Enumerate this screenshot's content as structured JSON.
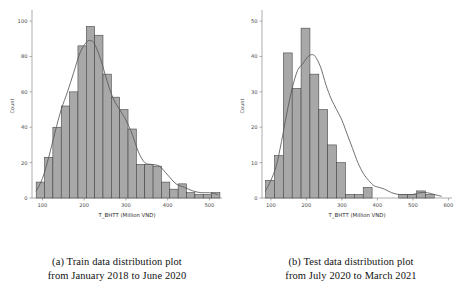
{
  "figure": {
    "panels": [
      {
        "id": "train",
        "caption_line1": "(a) Train data distribution plot",
        "caption_line2": "from January 2018 to June 2020"
      },
      {
        "id": "test",
        "caption_line1": "(b) Test data distribution plot",
        "caption_line2": "from July 2020 to March 2021"
      }
    ]
  },
  "chart_data": [
    {
      "type": "bar",
      "id": "train-histogram",
      "title": "",
      "xlabel": "T_BHTT (Million VND)",
      "ylabel": "Count",
      "xlim": [
        75,
        530
      ],
      "ylim": [
        0,
        104
      ],
      "xticks": [
        100,
        200,
        300,
        400,
        500
      ],
      "yticks": [
        0,
        20,
        40,
        60,
        80,
        100
      ],
      "grid": false,
      "legend": "none",
      "bin_width": 20,
      "bin_starts": [
        85,
        105,
        125,
        145,
        165,
        185,
        205,
        225,
        245,
        265,
        285,
        305,
        325,
        345,
        365,
        385,
        405,
        425,
        445,
        465,
        485,
        505
      ],
      "values": [
        9,
        23,
        40,
        52,
        60,
        86,
        97,
        92,
        70,
        57,
        50,
        39,
        19,
        19,
        18,
        9,
        5,
        8,
        3,
        2,
        2,
        3
      ],
      "kde": {
        "x": [
          85,
          100,
          115,
          130,
          145,
          160,
          175,
          190,
          205,
          215,
          225,
          240,
          255,
          270,
          285,
          300,
          315,
          330,
          345,
          360,
          380,
          400,
          420,
          440,
          460,
          480,
          500,
          520
        ],
        "y": [
          4,
          11,
          23,
          37,
          50,
          60,
          71,
          82,
          88,
          89,
          87,
          78,
          66,
          56,
          50,
          44,
          36,
          26,
          20,
          19,
          18,
          13,
          8,
          6,
          4,
          3,
          3,
          2
        ]
      }
    },
    {
      "type": "bar",
      "id": "test-histogram",
      "title": "",
      "xlabel": "T_BHTT (Million VND)",
      "ylabel": "Count",
      "xlim": [
        75,
        610
      ],
      "ylim": [
        0,
        52
      ],
      "xticks": [
        100,
        200,
        300,
        400,
        500,
        600
      ],
      "yticks": [
        0,
        10,
        20,
        30,
        40,
        50
      ],
      "grid": false,
      "legend": "none",
      "bin_width": 25,
      "bin_starts": [
        85,
        110,
        135,
        160,
        185,
        210,
        235,
        260,
        285,
        310,
        335,
        360,
        385,
        410,
        435,
        460,
        485,
        510,
        535,
        560
      ],
      "values": [
        5,
        12,
        41,
        31,
        48,
        35,
        25,
        15,
        10,
        1,
        1,
        3,
        0,
        0,
        0,
        1,
        1,
        2,
        1,
        0
      ],
      "kde": {
        "x": [
          85,
          100,
          115,
          130,
          145,
          160,
          175,
          190,
          205,
          215,
          225,
          240,
          255,
          270,
          285,
          300,
          315,
          330,
          345,
          360,
          375,
          390,
          405,
          420,
          440,
          460,
          480,
          500,
          520,
          540,
          560,
          580
        ],
        "y": [
          2,
          5,
          9,
          16,
          24,
          31,
          36,
          38,
          40,
          40.5,
          40,
          37,
          32,
          28,
          25,
          22,
          18,
          14,
          10,
          7,
          5,
          3.5,
          3,
          2.5,
          1.5,
          1,
          1,
          1,
          1.5,
          1.5,
          1,
          0.5
        ]
      }
    }
  ]
}
